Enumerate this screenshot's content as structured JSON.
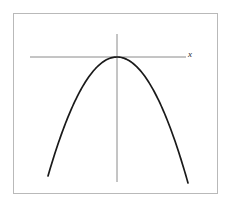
{
  "figure": {
    "title": "",
    "frame": {
      "x": 13,
      "y": 13,
      "width": 205,
      "height": 181,
      "stroke": "#b9b9b9",
      "stroke_width": 1,
      "background": "#ffffff"
    }
  },
  "labels": {
    "x_axis": "x"
  },
  "colors": {
    "curve": "#1a1a1a",
    "axis": "#8a8a8a",
    "frame": "#b9b9b9",
    "background": "#ffffff",
    "label_text": "#2a2a2a"
  },
  "chart_data": {
    "type": "line",
    "title": "",
    "xlabel": "x",
    "ylabel": "",
    "grid": false,
    "legend": null,
    "annotations": [
      {
        "text": "x",
        "role": "x-axis-name",
        "px": [
          190,
          56
        ]
      }
    ],
    "axes": {
      "x_axis": {
        "label": "x",
        "orientation": "horizontal",
        "px_start": [
          30,
          57
        ],
        "px_end": [
          186,
          57
        ],
        "tick_labels": []
      },
      "y_axis": {
        "label": "",
        "orientation": "vertical",
        "px_start": [
          117,
          34
        ],
        "px_end": [
          117,
          182
        ],
        "tick_labels": []
      }
    },
    "series": [
      {
        "name": "parabola",
        "equation": "y = -a(x - h)^2 + k",
        "opens": "downward",
        "vertex_px": [
          117,
          57
        ],
        "color": "#1a1a1a",
        "points_px": [
          [
            48,
            183
          ],
          [
            55,
            168
          ],
          [
            62,
            153
          ],
          [
            69,
            139
          ],
          [
            76,
            126
          ],
          [
            83,
            113
          ],
          [
            90,
            101
          ],
          [
            97,
            89
          ],
          [
            104,
            78
          ],
          [
            110,
            68
          ],
          [
            117,
            57
          ],
          [
            124,
            61
          ],
          [
            131,
            67
          ],
          [
            138,
            74
          ],
          [
            145,
            84
          ],
          [
            152,
            95
          ],
          [
            159,
            107
          ],
          [
            166,
            120
          ],
          [
            173,
            138
          ],
          [
            180,
            158
          ],
          [
            188,
            183
          ]
        ]
      }
    ],
    "xlim_px": [
      13,
      218
    ],
    "ylim_px": [
      13,
      194
    ]
  }
}
